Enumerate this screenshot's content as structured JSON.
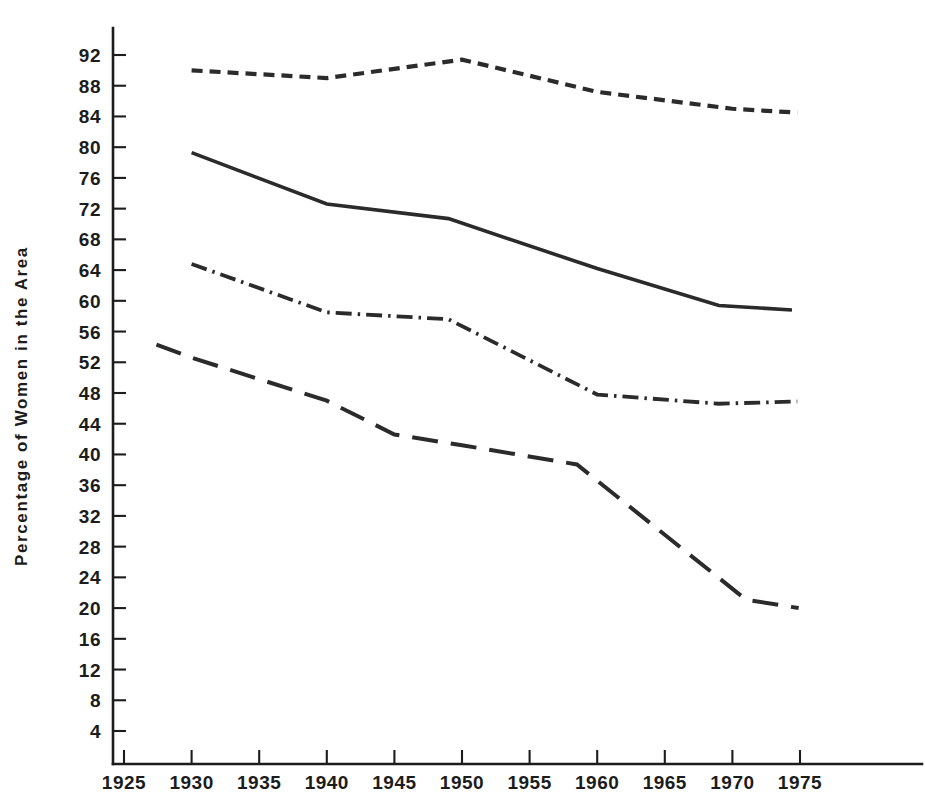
{
  "chart_data": {
    "type": "line",
    "title": "",
    "subtitle": "",
    "xlabel": "",
    "ylabel": "Percentage of Women in the Area",
    "xlim": [
      1922.5,
      1977
    ],
    "ylim": [
      0,
      94
    ],
    "grid": false,
    "legend": "none",
    "x_ticks": [
      1925,
      1930,
      1935,
      1940,
      1945,
      1950,
      1955,
      1960,
      1965,
      1970,
      1975
    ],
    "y_ticks": [
      4,
      8,
      12,
      16,
      20,
      24,
      28,
      32,
      36,
      40,
      44,
      48,
      52,
      56,
      60,
      64,
      68,
      72,
      76,
      80,
      84,
      88,
      92
    ],
    "line_color": "#2b2b2b",
    "series": [
      {
        "name": "series-1-short-dashed",
        "style": "short-dashed",
        "dasharray": "11 7",
        "width": 4.2,
        "x": [
          1930,
          1940,
          1950,
          1960,
          1970,
          1974.8
        ],
        "values": [
          90.0,
          89.0,
          91.4,
          87.2,
          85.0,
          84.5
        ]
      },
      {
        "name": "series-2-solid",
        "style": "solid",
        "dasharray": "none",
        "width": 3.6,
        "x": [
          1930,
          1940,
          1949,
          1960,
          1969,
          1974.4
        ],
        "values": [
          79.3,
          72.6,
          70.7,
          64.2,
          59.4,
          58.8
        ]
      },
      {
        "name": "series-3-dash-dot",
        "style": "dash-dot",
        "dasharray": "16 6 2.5 6",
        "width": 3.8,
        "x": [
          1930,
          1940,
          1949,
          1960,
          1969,
          1974.8
        ],
        "values": [
          64.8,
          58.5,
          57.6,
          47.8,
          46.6,
          46.9
        ]
      },
      {
        "name": "series-4-long-dashed",
        "style": "long-dashed",
        "dasharray": "26 13",
        "width": 4.0,
        "x": [
          1927.4,
          1930,
          1940,
          1945,
          1950,
          1958.5,
          1971,
          1974.9
        ],
        "values": [
          54.3,
          52.6,
          47.0,
          42.6,
          41.2,
          38.7,
          21.1,
          20.0
        ]
      }
    ]
  },
  "axes": {
    "y_axis_title": "Percentage of Women in the Area",
    "y_tick_labels": [
      "4",
      "8",
      "12",
      "16",
      "20",
      "24",
      "28",
      "32",
      "36",
      "40",
      "44",
      "48",
      "52",
      "56",
      "60",
      "64",
      "68",
      "72",
      "76",
      "80",
      "84",
      "88",
      "92"
    ],
    "x_tick_labels": [
      "1925",
      "1930",
      "1935",
      "1940",
      "1945",
      "1950",
      "1955",
      "1960",
      "1965",
      "1970",
      "1975"
    ]
  }
}
